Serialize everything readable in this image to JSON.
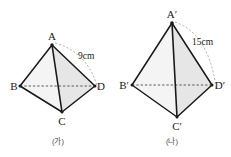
{
  "figure_set": {
    "description": "Two similar triangular pyramids (tetrahedra) shown side by side for a geometry problem",
    "background_color": "#ffffff",
    "edge_color": "#1a1a1a",
    "face_light_color": "#f2f2f2",
    "face_shade_color": "#e4e4e4",
    "hidden_edge_color": "#555555",
    "arc_color": "#9a9a9a"
  },
  "figures": [
    {
      "id": "figure-a",
      "caption": "(가)",
      "measure_label": "15cm",
      "vertices": {
        "apex": "A",
        "left": "B",
        "front": "C",
        "right": "D"
      }
    },
    {
      "id": "figure-b",
      "caption": "(나)",
      "measure_label": "15cm",
      "vertices": {
        "apex": "A′",
        "left": "B′",
        "front": "C′",
        "right": "D′"
      }
    }
  ],
  "left_figure": {
    "caption": "(가)",
    "measure": "9cm",
    "apex_label": "A",
    "left_label": "B",
    "front_label": "C",
    "right_label": "D"
  },
  "right_figure": {
    "caption": "(나)",
    "measure": "15cm",
    "apex_label": "A′",
    "left_label": "B′",
    "front_label": "C′",
    "right_label": "D′"
  }
}
